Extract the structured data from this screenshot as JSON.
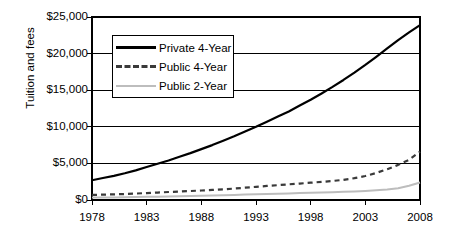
{
  "chart_data": {
    "type": "line",
    "title": "",
    "xlabel": "",
    "ylabel": "Tuition and fees",
    "xlim": [
      1978,
      2008
    ],
    "ylim": [
      0,
      25000
    ],
    "grid": true,
    "legend_position": "upper-left-inside",
    "x_tick_labels": [
      "1978",
      "1983",
      "1988",
      "1993",
      "1998",
      "2003",
      "2008"
    ],
    "x_ticks": [
      1978,
      1983,
      1988,
      1993,
      1998,
      2003,
      2008
    ],
    "y_tick_labels": [
      "$0",
      "$5,000",
      "$10,000",
      "$15,000",
      "$20,000",
      "$25,000"
    ],
    "y_ticks": [
      0,
      5000,
      10000,
      15000,
      20000,
      25000
    ],
    "x": [
      1978,
      1979,
      1980,
      1981,
      1982,
      1983,
      1984,
      1985,
      1986,
      1987,
      1988,
      1989,
      1990,
      1991,
      1992,
      1993,
      1994,
      1995,
      1996,
      1997,
      1998,
      1999,
      2000,
      2001,
      2002,
      2003,
      2004,
      2005,
      2006,
      2007,
      2008
    ],
    "series": [
      {
        "name": "Private 4-Year",
        "color": "#000000",
        "style": "solid",
        "width": 2.2,
        "values": [
          2700,
          3000,
          3300,
          3650,
          4050,
          4500,
          4950,
          5400,
          5900,
          6400,
          6950,
          7500,
          8100,
          8700,
          9350,
          10000,
          10700,
          11400,
          12100,
          12900,
          13700,
          14550,
          15450,
          16400,
          17400,
          18450,
          19550,
          20700,
          21850,
          22900,
          23900
        ]
      },
      {
        "name": "Public 4-Year",
        "color": "#3a3a3a",
        "style": "dashed",
        "width": 2.2,
        "values": [
          700,
          730,
          770,
          820,
          880,
          950,
          1020,
          1090,
          1160,
          1230,
          1300,
          1380,
          1460,
          1560,
          1680,
          1800,
          1920,
          2030,
          2140,
          2250,
          2360,
          2480,
          2600,
          2760,
          2980,
          3280,
          3700,
          4200,
          4800,
          5500,
          6600
        ]
      },
      {
        "name": "Public 2-Year",
        "color": "#bdbdbd",
        "style": "solid",
        "width": 2.0,
        "values": [
          330,
          340,
          355,
          375,
          400,
          430,
          460,
          490,
          520,
          550,
          580,
          615,
          650,
          690,
          735,
          780,
          820,
          860,
          900,
          940,
          980,
          1020,
          1060,
          1110,
          1170,
          1240,
          1320,
          1430,
          1600,
          1950,
          2400
        ]
      }
    ]
  },
  "axis": {
    "y_title": "Tuition and fees"
  },
  "legend": {
    "items": [
      {
        "label": "Private 4-Year",
        "swatch": "solid-dark-line-icon"
      },
      {
        "label": "Public 4-Year",
        "swatch": "dashed-line-icon"
      },
      {
        "label": "Public 2-Year",
        "swatch": "solid-light-line-icon"
      }
    ]
  },
  "colors": {
    "private_4_year": "#000000",
    "public_4_year": "#3a3a3a",
    "public_2_year": "#bdbdbd",
    "axis": "#000000",
    "grid": "#000000",
    "background": "#ffffff"
  }
}
